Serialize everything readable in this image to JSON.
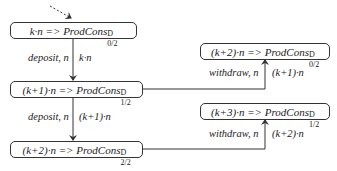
{
  "diagram": {
    "states": [
      {
        "id": "s0",
        "expr": "k·n =>",
        "name": "ProdCons",
        "superscript": "D",
        "subscript": "0/2"
      },
      {
        "id": "s1",
        "expr": "(k+1)·n =>",
        "name": "ProdCons",
        "superscript": "D",
        "subscript": "1/2"
      },
      {
        "id": "s2",
        "expr": "(k+2)·n =>",
        "name": "ProdCons",
        "superscript": "D",
        "subscript": "2/2"
      },
      {
        "id": "s3",
        "expr": "(k+2)·n =>",
        "name": "ProdCons",
        "superscript": "D",
        "subscript": "0/2"
      },
      {
        "id": "s4",
        "expr": "(k+3)·n =>",
        "name": "ProdCons",
        "superscript": "D",
        "subscript": "1/2"
      }
    ],
    "transitions": [
      {
        "from": "s0",
        "to": "s1",
        "action": "deposit, n",
        "value": "k·n"
      },
      {
        "from": "s1",
        "to": "s2",
        "action": "deposit, n",
        "value": "(k+1)·n"
      },
      {
        "from": "s1",
        "to": "s3",
        "action": "withdraw, n",
        "value": "(k+1)·n"
      },
      {
        "from": "s2",
        "to": "s4",
        "action": "withdraw, n",
        "value": "(k+2)·n"
      }
    ],
    "entry_arrow": "dashed"
  }
}
